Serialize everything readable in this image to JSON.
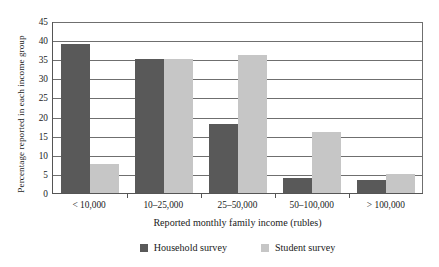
{
  "chart_data": {
    "type": "bar",
    "title": "",
    "xlabel": "Reported monthly family income (rubles)",
    "ylabel": "Percentage reported in each income group",
    "categories": [
      "< 10,000",
      "10–25,000",
      "25–50,000",
      "50–100,000",
      "> 100,000"
    ],
    "series": [
      {
        "name": "Household survey",
        "color": "#595959",
        "values": [
          39,
          35,
          18,
          4,
          3.5
        ]
      },
      {
        "name": "Student survey",
        "color": "#c6c6c6",
        "values": [
          7.5,
          35,
          36,
          16,
          5
        ]
      }
    ],
    "ylim": [
      0,
      45
    ],
    "ytick_step": 5,
    "yticks": [
      "45",
      "40",
      "35",
      "30",
      "25",
      "20",
      "15",
      "10",
      "5",
      "0"
    ],
    "grid": true,
    "legend_position": "bottom"
  }
}
